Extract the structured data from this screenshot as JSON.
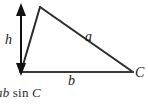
{
  "figure": {
    "type": "geometry-diagram",
    "background_color": "#ffffff",
    "stroke_color": "#2b2b2b",
    "labels": {
      "height": "h",
      "side_a": "a",
      "side_b": "b",
      "vertex_c": "C"
    },
    "caption": {
      "full_text": "ab sin C",
      "variables": "ab",
      "function": "sin",
      "angle": "C",
      "clipped_at_left": true
    },
    "geometry": {
      "apex": [
        40,
        7
      ],
      "bottom_left": [
        21,
        72
      ],
      "bottom_right": [
        133,
        72
      ],
      "height_arrow": {
        "x": 21,
        "y_top": 6,
        "y_bottom": 73,
        "double_headed": true
      }
    }
  }
}
